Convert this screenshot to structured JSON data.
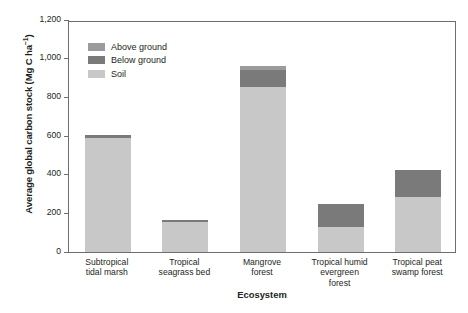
{
  "chart_data": {
    "type": "bar",
    "subtype": "stacked-vertical",
    "title": "",
    "xlabel": "Ecosystem",
    "ylabel": "Average global carbon stock (Mg C ha⁻¹)",
    "ylabel_parts": {
      "main": "Average global carbon stock (Mg C ha",
      "superscript": "−1",
      "tail": ")"
    },
    "categories": [
      "Subtropical tidal marsh",
      "Tropical seagrass bed",
      "Mangrove forest",
      "Tropical humid evergreen forest",
      "Tropical peat swamp forest"
    ],
    "category_lines": [
      [
        "Subtropical",
        "tidal marsh"
      ],
      [
        "Tropical",
        "seagrass bed"
      ],
      [
        "Mangrove",
        "forest"
      ],
      [
        "Tropical humid",
        "evergreen",
        "forest"
      ],
      [
        "Tropical peat",
        "swamp forest"
      ]
    ],
    "series": [
      {
        "name": "Above ground",
        "color": "#9b9b9b",
        "values": [
          0,
          0,
          20,
          0,
          0
        ]
      },
      {
        "name": "Below ground",
        "color": "#7a7a7a",
        "values": [
          15,
          10,
          85,
          120,
          140
        ]
      },
      {
        "name": "Soil",
        "color": "#c8c8c8",
        "values": [
          590,
          155,
          855,
          130,
          285
        ]
      }
    ],
    "stack_order_bottom_to_top": [
      "Soil",
      "Below ground",
      "Above ground"
    ],
    "totals": [
      605,
      165,
      960,
      250,
      425
    ],
    "ylim": [
      0,
      1200
    ],
    "yticks": [
      0,
      200,
      400,
      600,
      800,
      1000,
      1200
    ],
    "ytick_labels": [
      "0",
      "200",
      "400",
      "600",
      "800",
      "1,000",
      "1,200"
    ],
    "grid": false,
    "legend_position": "top-left",
    "frame_color": "#6d6e71",
    "background": "#ffffff"
  },
  "legend": {
    "items": [
      {
        "label": "Above ground",
        "color": "#9b9b9b"
      },
      {
        "label": "Below ground",
        "color": "#7a7a7a"
      },
      {
        "label": "Soil",
        "color": "#c8c8c8"
      }
    ]
  }
}
